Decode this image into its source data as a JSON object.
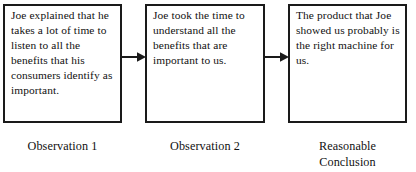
{
  "diagram": {
    "type": "flowchart",
    "orientation": "horizontal",
    "colors": {
      "background": "#ffffff",
      "border": "#1a1a1a",
      "text": "#111111",
      "arrow": "#1a1a1a"
    },
    "nodes": [
      {
        "id": "observation-1",
        "text": "Joe explained that he takes a lot of time to listen to all the benefits that his consumers identify as important.",
        "caption": "Observation 1"
      },
      {
        "id": "observation-2",
        "text": "Joe took the time to understand all the benefits that are important to us.",
        "caption": "Observation 2"
      },
      {
        "id": "reasonable-conclusion",
        "text": "The product that Joe showed us probably is the right machine for us.",
        "caption": "Reasonable\nConclusion"
      }
    ],
    "connectors": [
      {
        "id": "arrow-1",
        "from": "observation-1",
        "to": "observation-2",
        "style": "solid-arrow-right"
      },
      {
        "id": "arrow-2",
        "from": "observation-2",
        "to": "reasonable-conclusion",
        "style": "solid-arrow-right"
      }
    ]
  }
}
